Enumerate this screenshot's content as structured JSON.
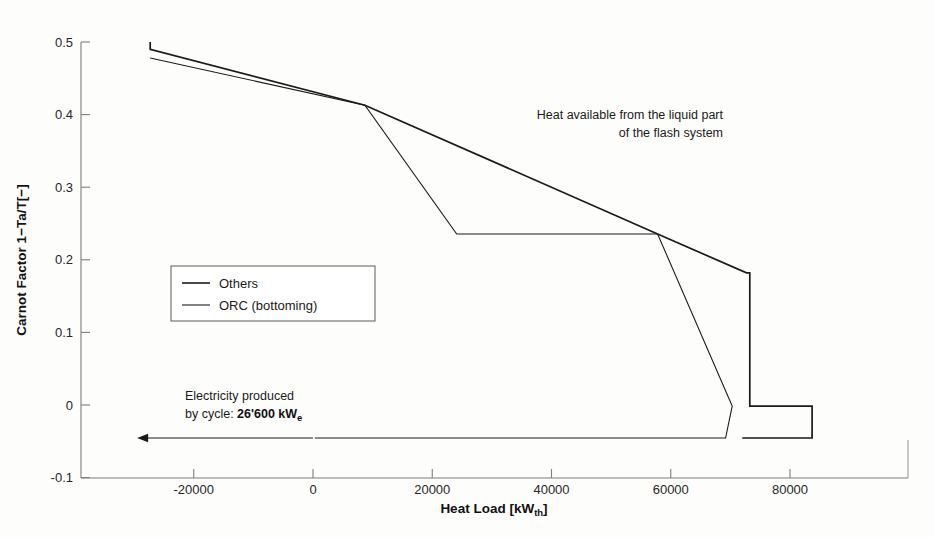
{
  "chart_data": {
    "type": "line",
    "title": "",
    "xlabel": "Heat Load [kWth]",
    "xlabel_main": "Heat Load [kW",
    "xlabel_sub": "th",
    "xlabel_tail": "]",
    "ylabel": "Carnot Factor 1−Ta/T[−]",
    "xlim": [
      -32000,
      90000
    ],
    "ylim": [
      -0.1,
      0.5
    ],
    "xticks": [
      -20000,
      0,
      20000,
      40000,
      60000,
      80000
    ],
    "xticklabels": [
      "-20000",
      "0",
      "20000",
      "40000",
      "60000",
      "80000"
    ],
    "yticks": [
      -0.1,
      0,
      0.1,
      0.2,
      0.3,
      0.4,
      0.5
    ],
    "yticklabels": [
      "-0.1",
      "0",
      "0.1",
      "0.2",
      "0.3",
      "0.4",
      "0.5"
    ],
    "grid": false,
    "legend_position": "center-left",
    "line_color": "#1a1a1a",
    "series": [
      {
        "name": "Others",
        "points": [
          [
            -27300,
            0.5
          ],
          [
            -27300,
            0.49
          ],
          [
            8700,
            0.413
          ],
          [
            57800,
            0.2355
          ],
          [
            72700,
            0.182
          ],
          [
            73250,
            0.182
          ],
          [
            73250,
            -0.0015
          ],
          [
            83700,
            -0.0015
          ],
          [
            83700,
            -0.0455
          ],
          [
            73250,
            -0.0455
          ],
          [
            72000,
            -0.0455
          ]
        ]
      },
      {
        "name": "ORC (bottoming)",
        "points": [
          [
            -27300,
            0.478
          ],
          [
            8700,
            0.413
          ],
          [
            24100,
            0.2355
          ],
          [
            57800,
            0.2355
          ],
          [
            70300,
            -0.0015
          ],
          [
            69200,
            -0.0455
          ],
          [
            300,
            -0.0455
          ]
        ]
      }
    ],
    "annotations": [
      {
        "name": "heat-available-note",
        "line1": "Heat available from the liquid part",
        "line2": "of the flash system",
        "x": 30000,
        "y": 0.395
      },
      {
        "name": "electricity-note",
        "line1": "Electricity produced",
        "line2_prefix": "by cycle: ",
        "line2_value": "26'600 kW",
        "line2_sub": "e",
        "x": -12000,
        "y": 0.015
      }
    ],
    "arrow": {
      "name": "electricity-flow-arrow",
      "from_x": 0,
      "to_x": -29500,
      "y": -0.0455,
      "direction": "left"
    }
  },
  "legend": {
    "entries": [
      {
        "label": "Others",
        "color": "#1a1a1a"
      },
      {
        "label": "ORC (bottoming)",
        "color": "#1a1a1a"
      }
    ]
  }
}
